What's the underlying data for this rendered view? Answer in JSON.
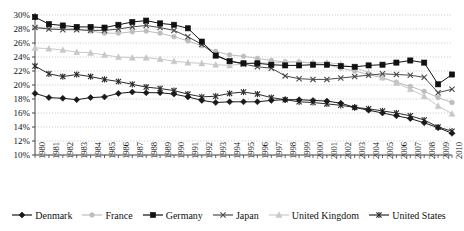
{
  "chart_data": {
    "type": "line",
    "title": "",
    "xlabel": "",
    "ylabel": "",
    "ylim": [
      10,
      30
    ],
    "ytick_step": 2,
    "grid": true,
    "legend_position": "bottom",
    "x": [
      1980,
      1981,
      1982,
      1983,
      1984,
      1985,
      1986,
      1987,
      1988,
      1989,
      1990,
      1991,
      1992,
      1993,
      1994,
      1995,
      1996,
      1997,
      1998,
      1999,
      2000,
      2001,
      2002,
      2003,
      2004,
      2005,
      2006,
      2007,
      2008,
      2009,
      2010
    ],
    "ytick_labels": [
      "30%",
      "28%",
      "26%",
      "24%",
      "22%",
      "20%",
      "18%",
      "16%",
      "14%",
      "12%",
      "10%"
    ],
    "xtick_labels": [
      "1980",
      "1981",
      "1982",
      "1983",
      "1984",
      "1985",
      "1986",
      "1987",
      "1988",
      "1989",
      "1990",
      "1991",
      "1992",
      "1993",
      "1994",
      "1995",
      "1996",
      "1997",
      "1998",
      "1999",
      "2000",
      "2001",
      "2002",
      "2003",
      "2004",
      "2005",
      "2006",
      "2007",
      "2008",
      "2009",
      "2010"
    ],
    "series": [
      {
        "name": "Denmark",
        "marker": "diamond",
        "color": "#1a1a1a",
        "values": [
          18.8,
          18.2,
          18.1,
          17.9,
          18.2,
          18.3,
          18.8,
          19.0,
          18.9,
          18.9,
          18.7,
          18.3,
          17.8,
          17.5,
          17.6,
          17.6,
          17.6,
          17.8,
          17.9,
          17.9,
          17.8,
          17.7,
          17.4,
          16.8,
          16.4,
          16.0,
          15.6,
          15.2,
          14.6,
          13.9,
          13.1
        ],
        "legend_label": "Denmark"
      },
      {
        "name": "France",
        "marker": "circle",
        "color": "#bdbdbd",
        "values": [
          28.3,
          28.1,
          28.2,
          28.0,
          27.7,
          27.4,
          27.4,
          27.6,
          27.7,
          27.4,
          26.9,
          26.3,
          25.6,
          24.8,
          24.3,
          24.1,
          23.8,
          23.5,
          23.3,
          23.3,
          23.1,
          22.9,
          22.4,
          22.0,
          21.5,
          21.0,
          20.4,
          19.8,
          19.1,
          18.2,
          17.5
        ],
        "legend_label": "France"
      },
      {
        "name": "Germany",
        "marker": "square",
        "color": "#111111",
        "values": [
          29.7,
          28.7,
          28.5,
          28.3,
          28.3,
          28.2,
          28.6,
          29.0,
          29.2,
          28.8,
          28.6,
          28.1,
          26.2,
          24.2,
          23.4,
          23.1,
          23.1,
          22.9,
          22.8,
          22.8,
          22.9,
          22.9,
          22.7,
          22.6,
          22.8,
          22.9,
          23.2,
          23.5,
          23.2,
          20.1,
          21.5
        ],
        "legend_label": "Germany"
      },
      {
        "name": "Japan",
        "marker": "cross",
        "color": "#4a4a4a",
        "values": [
          28.2,
          28.0,
          27.9,
          27.9,
          27.8,
          27.8,
          28.0,
          28.3,
          28.5,
          28.2,
          27.8,
          26.9,
          25.8,
          24.3,
          23.4,
          23.0,
          22.6,
          22.4,
          21.3,
          20.9,
          20.8,
          20.8,
          21.0,
          21.2,
          21.4,
          21.6,
          21.5,
          21.4,
          21.1,
          18.9,
          19.4
        ],
        "legend_label": "Japan"
      },
      {
        "name": "United Kingdom",
        "marker": "triangle",
        "color": "#c8c8c8",
        "values": [
          25.3,
          25.2,
          25.0,
          24.7,
          24.6,
          24.3,
          24.0,
          23.9,
          23.9,
          23.7,
          23.4,
          23.2,
          23.1,
          22.9,
          22.8,
          23.0,
          23.2,
          23.1,
          23.3,
          23.3,
          23.2,
          23.2,
          23.0,
          22.5,
          21.8,
          21.1,
          20.3,
          19.4,
          18.4,
          17.0,
          15.9
        ],
        "legend_label": "United Kingdom"
      },
      {
        "name": "United States",
        "marker": "asterisk",
        "color": "#2b2b2b",
        "values": [
          22.7,
          21.6,
          21.2,
          21.5,
          21.2,
          20.8,
          20.5,
          20.1,
          19.7,
          19.5,
          19.2,
          18.7,
          18.3,
          18.4,
          18.8,
          19.0,
          18.7,
          18.2,
          17.9,
          17.6,
          17.5,
          17.3,
          17.1,
          16.8,
          16.6,
          16.3,
          16.0,
          15.6,
          15.0,
          14.0,
          13.4
        ],
        "legend_label": "United States"
      }
    ]
  },
  "legend": {
    "items": [
      {
        "label": "Denmark"
      },
      {
        "label": "France"
      },
      {
        "label": "Germany"
      },
      {
        "label": "Japan"
      },
      {
        "label": "United Kingdom"
      },
      {
        "label": "United States"
      }
    ]
  }
}
